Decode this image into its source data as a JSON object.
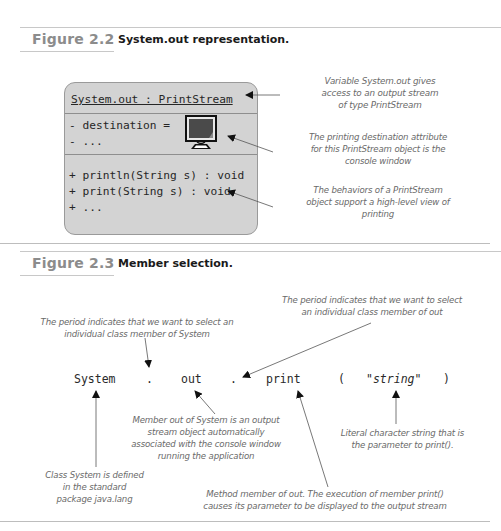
{
  "figure_2_2": {
    "number": "Figure 2.2",
    "title": "System.out representation.",
    "uml": {
      "header": "System.out : PrintStream",
      "attributes": [
        "- destination =",
        "- ..."
      ],
      "destination_icon": "monitor-icon",
      "methods": [
        "+ println(String s) : void",
        "+ print(String s) : void",
        "+ ..."
      ]
    },
    "annotations": [
      {
        "lines": [
          "Variable System.out  gives",
          "access to an output stream",
          "of type PrintStream"
        ]
      },
      {
        "lines": [
          "The printing destination attribute",
          "for this PrintStream object is the",
          "console window"
        ]
      },
      {
        "lines": [
          "The behaviors of a PrintStream",
          "object support a high-level view of",
          "printing"
        ]
      }
    ]
  },
  "figure_2_3": {
    "number": "Figure 2.3",
    "title": "Member selection.",
    "expression": {
      "tokens": [
        "System",
        ".",
        "out",
        ".",
        "print",
        "(",
        "\"",
        "string",
        "\"",
        ")"
      ]
    },
    "annotations": [
      {
        "id": "period-out",
        "lines": [
          "The period indicates that we want to select",
          "an individual class member of out"
        ]
      },
      {
        "id": "period-system",
        "lines": [
          "The period indicates that we want to select an",
          "individual class member of System"
        ]
      },
      {
        "id": "member-out",
        "lines": [
          "Member out of System is an output",
          "stream object automatically",
          "associated with the console window",
          "running the application"
        ]
      },
      {
        "id": "literal",
        "lines": [
          "Literal character string that is",
          "the  parameter to print()."
        ]
      },
      {
        "id": "class-system",
        "lines": [
          "Class System is defined",
          "in the standard",
          "package java.lang"
        ]
      },
      {
        "id": "method-print",
        "lines": [
          "Method member of out. The execution of member print()",
          "causes its parameter to be displayed to the output stream"
        ]
      }
    ]
  },
  "colors": {
    "uml_fill": "#d3d3d3",
    "figure_number": "#8c8c8c",
    "annotation_text": "#6a6a6a",
    "rule": "#c8c8c8"
  }
}
